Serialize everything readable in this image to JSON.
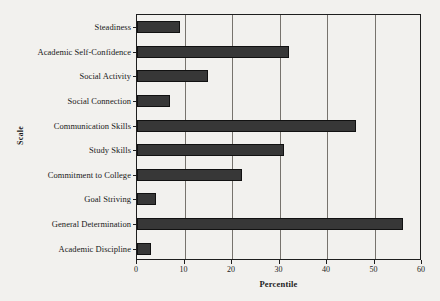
{
  "chart_data": {
    "type": "bar",
    "orientation": "horizontal",
    "title": "",
    "xlabel": "Percentile",
    "ylabel": "Scale",
    "xlim": [
      0,
      60
    ],
    "xticks": [
      0,
      10,
      20,
      30,
      40,
      50,
      60
    ],
    "xtick_labels": [
      "0",
      "10",
      "20",
      "30",
      "40",
      "50",
      "60"
    ],
    "grid": "vertical",
    "legend": "none",
    "bar_color": "#373737",
    "background_color": "#f2f1ee",
    "axis_color": "#1e1e1e",
    "categories": [
      "Steadiness",
      "Academic Self-Confidence",
      "Social Activity",
      "Social Connection",
      "Communication Skills",
      "Study Skills",
      "Commitment to College",
      "Goal Striving",
      "General Determination",
      "Academic Discipline"
    ],
    "values": [
      9,
      32,
      15,
      7,
      46,
      31,
      22,
      4,
      56,
      3
    ]
  }
}
